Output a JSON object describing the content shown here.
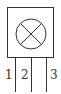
{
  "diagram": {
    "type": "component-symbol",
    "symbol": "circle-with-cross",
    "stroke_color": "#333333",
    "background": "#ffffff",
    "pins": [
      {
        "label": "1"
      },
      {
        "label": "2"
      },
      {
        "label": "3"
      }
    ]
  }
}
